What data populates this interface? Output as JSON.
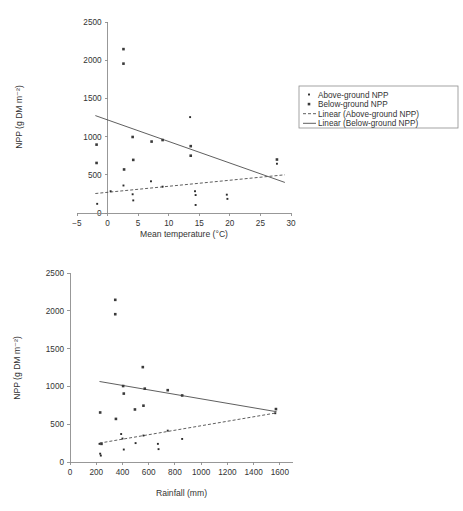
{
  "figure": {
    "background": "#ffffff",
    "marker_color": "#2b2b2b",
    "line_color": "#4d4d4d",
    "axis_color": "#8d8d8d"
  },
  "legend": {
    "position": "right-of-top-chart",
    "items": [
      {
        "label": "Above-ground NPP",
        "marker": "small-square-marker",
        "style": "marker"
      },
      {
        "label": "Below-ground NPP",
        "marker": "square-marker",
        "style": "marker"
      },
      {
        "label": "Linear (Above-ground NPP)",
        "marker": "dashed-line-swatch",
        "style": "dashed"
      },
      {
        "label": "Linear (Below-ground NPP)",
        "marker": "solid-line-swatch",
        "style": "solid"
      }
    ]
  },
  "chart_data": [
    {
      "id": "npp-vs-temperature",
      "type": "scatter",
      "title": "",
      "xlabel": "Mean temperature (°C)",
      "ylabel": "NPP (g DM m⁻²)",
      "xlim": [
        -5,
        30
      ],
      "ylim": [
        0,
        2500
      ],
      "xticks": [
        -5,
        0,
        5,
        10,
        15,
        20,
        25,
        30
      ],
      "yticks": [
        0,
        500,
        1000,
        1500,
        2000,
        2500
      ],
      "xtick_labels": [
        "−5",
        "0",
        "5",
        "10",
        "15",
        "20",
        "25",
        "30"
      ],
      "ytick_labels": [
        "0",
        "500",
        "1000",
        "1500",
        "2000",
        "2500"
      ],
      "grid": false,
      "series": [
        {
          "name": "Above-ground NPP",
          "marker": "small-square-marker",
          "points": [
            [
              -1.7,
              120
            ],
            [
              0.5,
              285
            ],
            [
              2.6,
              360
            ],
            [
              4.1,
              245
            ],
            [
              4.2,
              165
            ],
            [
              7.1,
              415
            ],
            [
              9.0,
              345
            ],
            [
              13.5,
              1255
            ],
            [
              14.3,
              285
            ],
            [
              14.4,
              235
            ],
            [
              14.4,
              105
            ],
            [
              19.5,
              240
            ],
            [
              19.6,
              185
            ],
            [
              27.7,
              645
            ]
          ]
        },
        {
          "name": "Below-ground NPP",
          "marker": "square-marker",
          "points": [
            [
              -1.8,
              895
            ],
            [
              -1.8,
              655
            ],
            [
              2.6,
              2145
            ],
            [
              2.6,
              1955
            ],
            [
              2.7,
              570
            ],
            [
              4.1,
              995
            ],
            [
              4.2,
              695
            ],
            [
              7.2,
              935
            ],
            [
              9.0,
              955
            ],
            [
              13.6,
              875
            ],
            [
              13.6,
              750
            ],
            [
              27.7,
              700
            ]
          ]
        }
      ],
      "trendlines": [
        {
          "name": "Linear (Above-ground NPP)",
          "style": "dashed",
          "x0": -2.0,
          "y0": 255,
          "x1": 29.0,
          "y1": 500
        },
        {
          "name": "Linear (Below-ground NPP)",
          "style": "solid",
          "x0": -2.0,
          "y0": 1275,
          "x1": 29.0,
          "y1": 400
        }
      ]
    },
    {
      "id": "npp-vs-rainfall",
      "type": "scatter",
      "title": "",
      "xlabel": "Rainfall (mm)",
      "ylabel": "NPP (g DM m⁻²)",
      "xlim": [
        0,
        1700
      ],
      "ylim": [
        0,
        2500
      ],
      "xticks": [
        0,
        200,
        400,
        600,
        800,
        1000,
        1200,
        1400,
        1600
      ],
      "yticks": [
        0,
        500,
        1000,
        1500,
        2000,
        2500
      ],
      "xtick_labels": [
        "0",
        "200",
        "400",
        "600",
        "800",
        "1000",
        "1200",
        "1400",
        "1600"
      ],
      "ytick_labels": [
        "0",
        "500",
        "1000",
        "1500",
        "2000",
        "2500"
      ],
      "grid": false,
      "series": [
        {
          "name": "Above-ground NPP",
          "marker": "small-square-marker",
          "points": [
            [
              225,
              240
            ],
            [
              230,
              110
            ],
            [
              235,
              85
            ],
            [
              390,
              370
            ],
            [
              400,
              310
            ],
            [
              410,
              165
            ],
            [
              500,
              250
            ],
            [
              560,
              350
            ],
            [
              670,
              240
            ],
            [
              675,
              170
            ],
            [
              745,
              415
            ],
            [
              855,
              305
            ],
            [
              1565,
              645
            ]
          ]
        },
        {
          "name": "Below-ground NPP",
          "marker": "square-marker",
          "points": [
            [
              230,
              655
            ],
            [
              240,
              240
            ],
            [
              345,
              2145
            ],
            [
              345,
              1955
            ],
            [
              350,
              570
            ],
            [
              405,
              1005
            ],
            [
              410,
              905
            ],
            [
              495,
              695
            ],
            [
              555,
              1255
            ],
            [
              560,
              745
            ],
            [
              570,
              970
            ],
            [
              745,
              950
            ],
            [
              855,
              880
            ],
            [
              1570,
              700
            ]
          ]
        }
      ],
      "trendlines": [
        {
          "name": "Linear (Above-ground NPP)",
          "style": "dashed",
          "x0": 225,
          "y0": 250,
          "x1": 1575,
          "y1": 650
        },
        {
          "name": "Linear (Below-ground NPP)",
          "style": "solid",
          "x0": 225,
          "y0": 1065,
          "x1": 1575,
          "y1": 665
        }
      ]
    }
  ]
}
